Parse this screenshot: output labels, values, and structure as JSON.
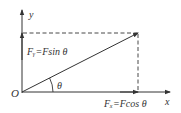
{
  "diagram": {
    "labels": {
      "y_axis": "y",
      "x_axis": "x",
      "origin": "O",
      "angle": "θ",
      "fy": "Fᵧ=Fsin θ",
      "fx": "Fₓ=Fcos θ"
    },
    "colors": {
      "line": "#333333",
      "background": "#ffffff"
    }
  }
}
